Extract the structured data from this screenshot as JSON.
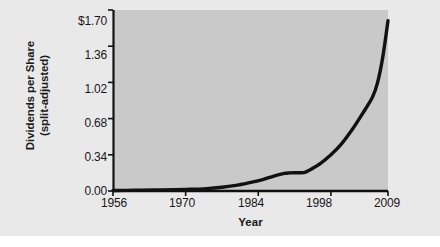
{
  "chart_data": {
    "type": "line",
    "title": "",
    "xlabel": "Year",
    "ylabel": "Dividends per Share (split-adjusted)",
    "ylabel_lines": [
      "Dividends per Share",
      "(split-adjusted)"
    ],
    "xlim": [
      1956,
      2009
    ],
    "ylim": [
      0.0,
      1.7
    ],
    "grid": false,
    "legend": null,
    "x_ticks": [
      1956,
      1970,
      1984,
      1998,
      2009
    ],
    "x_tick_labels": [
      "1956",
      "1970",
      "1984",
      "1998",
      "2009"
    ],
    "y_ticks": [
      0.0,
      0.34,
      0.68,
      1.02,
      1.36,
      1.7
    ],
    "y_tick_labels": [
      "0.00",
      "0.34",
      "0.68",
      "1.02",
      "1.36",
      "$1.70"
    ],
    "series": [
      {
        "name": "Dividends per Share (split-adjusted)",
        "color": "#111111",
        "line_width": 3.4,
        "x": [
          1956,
          1960,
          1964,
          1968,
          1971,
          1974,
          1977,
          1980,
          1983,
          1985,
          1987,
          1989,
          1990,
          1991,
          1992,
          1993,
          1994,
          1996,
          1998,
          2000,
          2002,
          2004,
          2006,
          2007,
          2008,
          2009
        ],
        "y": [
          0.005,
          0.007,
          0.009,
          0.012,
          0.016,
          0.022,
          0.035,
          0.055,
          0.085,
          0.11,
          0.14,
          0.165,
          0.17,
          0.172,
          0.172,
          0.175,
          0.2,
          0.26,
          0.34,
          0.44,
          0.57,
          0.72,
          0.88,
          1.02,
          1.26,
          1.6
        ]
      }
    ]
  },
  "axes": {
    "plot_bg_color": "#c9c9c9",
    "page_bg_color": "#e9e9e9",
    "axis_color": "#111111"
  }
}
